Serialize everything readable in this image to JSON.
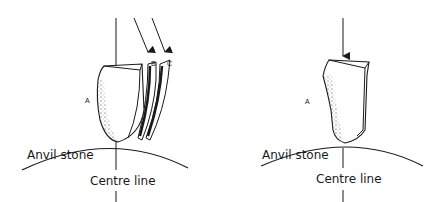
{
  "figures": [
    {
      "id": "left",
      "description": "Bipolar flaking: stone struck on anvil producing flakes B and C",
      "labels": {
        "core": "A",
        "flake_b": "B",
        "flake_c": "C",
        "anvil": "Anvil stone",
        "centre": "Centre line"
      },
      "arrows": 3
    },
    {
      "id": "right",
      "description": "Stone A struck vertically on anvil stone",
      "labels": {
        "core": "A",
        "anvil": "Anvil stone",
        "centre": "Centre line"
      },
      "arrows": 1
    }
  ],
  "colors": {
    "ink": "#1a1a1a",
    "background": "#ffffff"
  }
}
